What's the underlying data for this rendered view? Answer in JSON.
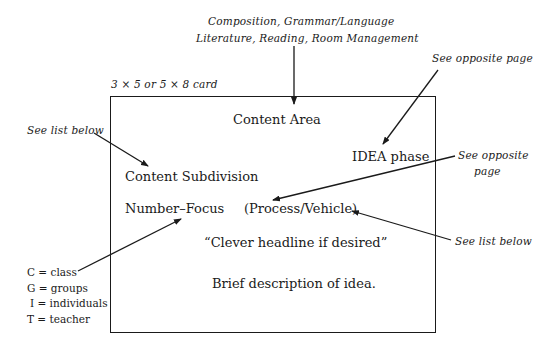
{
  "top_label": {
    "line1": "Composition, Grammar/Language",
    "line2": "Literature, Reading, Room Management"
  },
  "card_size_label": "3 × 5 or 5 × 8 card",
  "card": {
    "content_area": "Content Area",
    "idea_phase": "IDEA phase",
    "content_subdivision": "Content Subdivision",
    "number_focus": "Number–Focus",
    "process_vehicle": "(Process/Vehicle)",
    "headline": "“Clever headline if desired”",
    "description": "Brief description of idea."
  },
  "annotations": {
    "see_list_below_left": "See list below",
    "see_opposite_page_top": "See opposite page",
    "see_opposite_page_right_line1": "See opposite",
    "see_opposite_page_right_line2": "page",
    "see_list_below_right": "See list below"
  },
  "legend": [
    "C = class",
    "G = groups",
    "I = individuals",
    "T = teacher"
  ],
  "colors": {
    "ink": "#1a1a1a",
    "background": "#ffffff"
  }
}
